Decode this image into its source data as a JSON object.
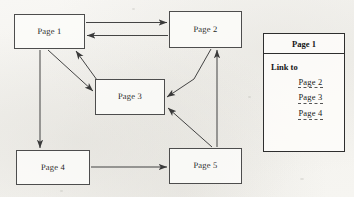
{
  "diagram": {
    "nodes": [
      {
        "id": "page1",
        "label": "Page 1",
        "x": 14,
        "y": 14,
        "w": 71,
        "h": 35
      },
      {
        "id": "page2",
        "label": "Page 2",
        "x": 169,
        "y": 11,
        "w": 73,
        "h": 37
      },
      {
        "id": "page3",
        "label": "Page 3",
        "x": 95,
        "y": 79,
        "w": 70,
        "h": 36
      },
      {
        "id": "page4",
        "label": "Page 4",
        "x": 16,
        "y": 150,
        "w": 74,
        "h": 35
      },
      {
        "id": "page5",
        "label": "Page 5",
        "x": 169,
        "y": 148,
        "w": 73,
        "h": 36
      }
    ],
    "edges": [
      {
        "id": "e1",
        "from": "page1",
        "to": "page2",
        "kind": "straight",
        "direction": "forward"
      },
      {
        "id": "e2",
        "from": "page2",
        "to": "page1",
        "kind": "straight",
        "direction": "forward"
      },
      {
        "id": "e3",
        "from": "page1",
        "to": "page3",
        "kind": "diagonal",
        "direction": "forward"
      },
      {
        "id": "e4",
        "from": "page3",
        "to": "page1",
        "kind": "diagonal",
        "direction": "forward"
      },
      {
        "id": "e5",
        "from": "page1",
        "to": "page4",
        "kind": "vertical",
        "direction": "forward"
      },
      {
        "id": "e6",
        "from": "page4",
        "to": "page5",
        "kind": "straight",
        "direction": "forward"
      },
      {
        "id": "e7",
        "from": "page2",
        "to": "page3",
        "kind": "bent",
        "direction": "forward"
      },
      {
        "id": "e8",
        "from": "page5",
        "to": "page3",
        "kind": "diagonal",
        "direction": "forward"
      },
      {
        "id": "e9",
        "from": "page5",
        "to": "page2",
        "kind": "vertical",
        "direction": "forward"
      }
    ],
    "stroke_color": "#3a3a3a",
    "node_border_color": "#4d4d4d",
    "background_color": "#f6f5f2"
  },
  "legend": {
    "header": "Page 1",
    "link_to_label": "Link to",
    "links": [
      {
        "label": "Page 2"
      },
      {
        "label": "Page 3"
      },
      {
        "label": "Page 4"
      }
    ]
  }
}
